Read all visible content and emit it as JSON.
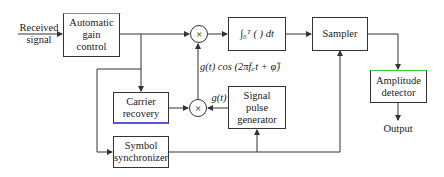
{
  "diagram": {
    "input_label": "Received\nsignal",
    "blocks": {
      "agc": "Automatic\ngain\ncontrol",
      "integrator": "∫₀ᵀ ( ) dt",
      "sampler": "Sampler",
      "amplitude_detector": "Amplitude\ndetector",
      "carrier_recovery": "Carrier\nrecovery",
      "signal_pulse_generator": "Signal\npulse\ngenerator",
      "symbol_synchronizer": "Symbol\nsynchronizer"
    },
    "multiplier_symbol": "×",
    "signal_labels": {
      "reference": "g(t) cos (2πf꜀t + φ̂)",
      "pulse": "g(t)"
    },
    "output_label": "Output",
    "colors": {
      "line": "#333333",
      "agc_top_accent": "#33cc33",
      "carrier_bottom_accent": "#5a5ad0"
    }
  }
}
